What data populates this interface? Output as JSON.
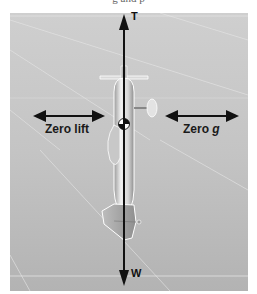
{
  "figure": {
    "top_caption": "g and p",
    "forces": {
      "thrust_label": "T",
      "weight_label": "W"
    },
    "annotations": {
      "left": {
        "text": "Zero lift"
      },
      "right": {
        "prefix": "Zero ",
        "symbol": "g"
      }
    },
    "colors": {
      "background": "#c8c8c8",
      "arrow": "#111111",
      "aircraft_body": "#e6e6e6",
      "aircraft_outline": "#ffffff"
    }
  }
}
